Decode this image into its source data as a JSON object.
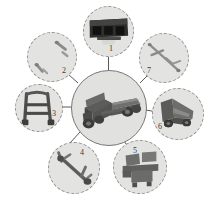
{
  "figure": {
    "background_color": "#ffffff",
    "satellite_fill": "#e3e3e2",
    "satellite_border": "#8e8e8d",
    "center_fill": "#e1e1e0",
    "center_border": "#777776",
    "connector_color": "#5a5a5a",
    "dark_part_color": "#3c3c3c",
    "mid_part_color": "#6f6f6e",
    "light_part_color": "#a9a9a8"
  },
  "center": {
    "name": "assembled-truck",
    "caption": ""
  },
  "parts": [
    {
      "number": "1",
      "name": "truck-bed-body",
      "tone": "dark"
    },
    {
      "number": "2",
      "name": "small-fasteners",
      "tone": "light"
    },
    {
      "number": "3",
      "name": "ladder-frame-rail",
      "tone": "mid"
    },
    {
      "number": "4",
      "name": "axle-linkage-arm",
      "tone": "mid"
    },
    {
      "number": "5",
      "name": "bracket-mount-plate",
      "tone": "mid"
    },
    {
      "number": "6",
      "name": "dump-bed-with-wheels",
      "tone": "mid"
    },
    {
      "number": "7",
      "name": "drive-shaft-rod",
      "tone": "light"
    }
  ]
}
